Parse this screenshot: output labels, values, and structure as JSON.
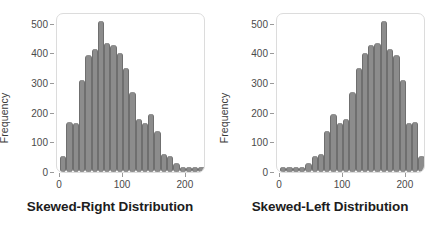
{
  "figure": {
    "width": 441,
    "height": 239,
    "background": "#ffffff",
    "bar_color": "#8c8c8c",
    "frame_color": "#dcdcdc",
    "text_color": "#3b3b3b"
  },
  "panels": [
    {
      "key": "skewed_right",
      "caption": "Skewed-Right Distribution",
      "ylabel": "Frequency",
      "yticks": [
        "0",
        "100",
        "200",
        "300",
        "400",
        "500"
      ],
      "xticks": [
        "0",
        "100",
        "200"
      ]
    },
    {
      "key": "skewed_left",
      "caption": "Skewed-Left Distribution",
      "ylabel": "Frequency",
      "yticks": [
        "0",
        "100",
        "200",
        "300",
        "400",
        "500"
      ],
      "xticks": [
        "0",
        "100",
        "200"
      ]
    }
  ],
  "chart_data": [
    {
      "type": "bar",
      "title": "Skewed-Right Distribution",
      "xlabel": "",
      "ylabel": "Frequency",
      "xlim": [
        -5,
        232
      ],
      "ylim": [
        0,
        540
      ],
      "yticks": [
        0,
        100,
        200,
        300,
        400,
        500
      ],
      "xticks": [
        0,
        100,
        200
      ],
      "grid": false,
      "legend": null,
      "bin_width": 10,
      "x": [
        5,
        15,
        25,
        35,
        45,
        55,
        65,
        75,
        85,
        95,
        105,
        115,
        125,
        135,
        145,
        155,
        165,
        175,
        185,
        195,
        205,
        215,
        225
      ],
      "values": [
        55,
        170,
        165,
        310,
        395,
        415,
        510,
        435,
        430,
        400,
        350,
        270,
        180,
        165,
        195,
        140,
        60,
        55,
        30,
        10,
        8,
        8,
        8
      ]
    },
    {
      "type": "bar",
      "title": "Skewed-Left Distribution",
      "xlabel": "",
      "ylabel": "Frequency",
      "xlim": [
        -5,
        232
      ],
      "ylim": [
        0,
        540
      ],
      "yticks": [
        0,
        100,
        200,
        300,
        400,
        500
      ],
      "xticks": [
        0,
        100,
        200
      ],
      "grid": false,
      "legend": null,
      "bin_width": 10,
      "x": [
        5,
        15,
        25,
        35,
        45,
        55,
        65,
        75,
        85,
        95,
        105,
        115,
        125,
        135,
        145,
        155,
        165,
        175,
        185,
        195,
        205,
        215,
        225
      ],
      "values": [
        8,
        8,
        8,
        10,
        30,
        55,
        60,
        140,
        195,
        165,
        180,
        270,
        350,
        400,
        430,
        435,
        510,
        415,
        395,
        310,
        165,
        170,
        55
      ]
    }
  ]
}
